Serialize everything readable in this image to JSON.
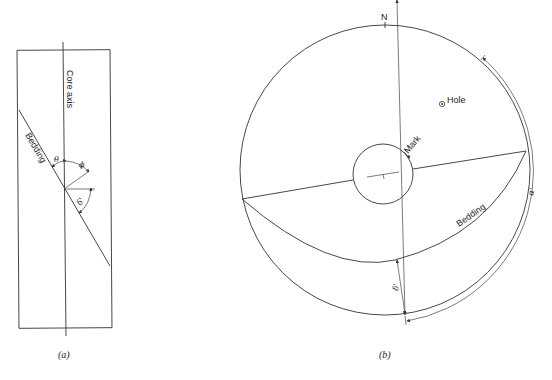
{
  "figure_a": {
    "caption": "(a)",
    "labels": {
      "core_axis": "Core axis",
      "bedding": "Bedding",
      "theta": "θ",
      "phi": "ϕ",
      "delta_prime": "δ'"
    }
  },
  "figure_b": {
    "caption": "(b)",
    "labels": {
      "north": "N",
      "hole": "Hole",
      "mark": "Mark",
      "bedding": "Bedding",
      "delta_prime": "δ'",
      "alpha_prime": "α'"
    }
  }
}
